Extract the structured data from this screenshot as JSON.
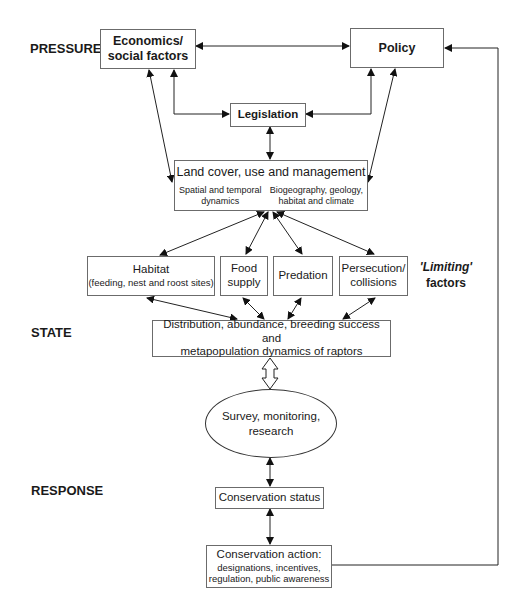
{
  "levels": {
    "pressures": "PRESSURES",
    "state": "STATE",
    "response": "RESPONSE"
  },
  "nodes": {
    "economics": {
      "line1": "Economics/",
      "line2": "social factors"
    },
    "policy": {
      "label": "Policy"
    },
    "legislation": {
      "label": "Legislation"
    },
    "land_cover": {
      "title": "Land cover, use and management",
      "left_line1": "Spatial and temporal",
      "left_line2": "dynamics",
      "right_line1": "Biogeography, geology,",
      "right_line2": "habitat and climate"
    },
    "habitat": {
      "line1": "Habitat",
      "line2": "(feeding, nest and roost sites)"
    },
    "food_supply": {
      "line1": "Food",
      "line2": "supply"
    },
    "predation": {
      "label": "Predation"
    },
    "persecution": {
      "line1": "Persecution/",
      "line2": "collisions"
    },
    "limiting_factors": {
      "line1": "'Limiting'",
      "line2": "factors"
    },
    "state_box": {
      "line1": "Distribution, abundance, breeding success and",
      "line2": "metapopulation dynamics of raptors"
    },
    "survey": {
      "line1": "Survey, monitoring,",
      "line2": "research"
    },
    "conservation_status": {
      "label": "Conservation status"
    },
    "conservation_action": {
      "title": "Conservation action:",
      "line2": "designations, incentives,",
      "line3": "regulation, public awareness"
    }
  },
  "colors": {
    "line": "#222222",
    "border": "#6b6b6b",
    "background": "#ffffff"
  }
}
